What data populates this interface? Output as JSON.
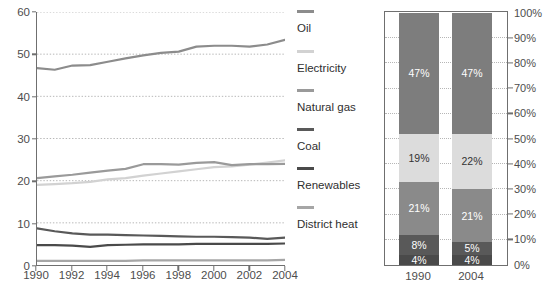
{
  "chart_data": [
    {
      "type": "line",
      "title": "",
      "xlabel": "",
      "ylabel": "EJ",
      "xlim": [
        1990,
        2004
      ],
      "ylim": [
        0,
        60
      ],
      "grid": true,
      "x": [
        1990,
        1991,
        1992,
        1993,
        1994,
        1995,
        1996,
        1997,
        1998,
        1999,
        2000,
        2001,
        2002,
        2003,
        2004
      ],
      "xticks": [
        "1990",
        "1992",
        "1994",
        "1996",
        "1998",
        "2000",
        "2002",
        "2004"
      ],
      "yticks": [
        "0",
        "10",
        "20",
        "30",
        "40",
        "50",
        "60"
      ],
      "legend_position": "right",
      "series": [
        {
          "name": "Oil",
          "color": "#8c8c8c",
          "values": [
            46.7,
            46.3,
            47.3,
            47.4,
            48.2,
            49.0,
            49.7,
            50.3,
            50.6,
            51.8,
            52.0,
            52.0,
            51.8,
            52.3,
            53.4
          ]
        },
        {
          "name": "Electricity",
          "color": "#d2d2d2",
          "values": [
            19.0,
            19.2,
            19.4,
            19.7,
            20.3,
            20.6,
            21.2,
            21.7,
            22.2,
            22.7,
            23.2,
            23.4,
            23.8,
            24.3,
            24.8
          ]
        },
        {
          "name": "Natural gas",
          "color": "#9a9a9a",
          "values": [
            20.6,
            21.0,
            21.4,
            21.9,
            22.4,
            22.8,
            23.9,
            23.9,
            23.8,
            24.2,
            24.4,
            23.7,
            23.9,
            23.9,
            24.0
          ]
        },
        {
          "name": "Coal",
          "color": "#595959",
          "values": [
            8.7,
            8.0,
            7.5,
            7.2,
            7.2,
            7.1,
            7.0,
            6.9,
            6.8,
            6.7,
            6.7,
            6.6,
            6.5,
            6.2,
            6.5
          ]
        },
        {
          "name": "Renewables",
          "color": "#4a4a4a",
          "values": [
            4.7,
            4.7,
            4.6,
            4.3,
            4.7,
            4.8,
            4.9,
            4.9,
            4.9,
            5.0,
            5.0,
            5.0,
            5.0,
            5.0,
            5.1
          ]
        },
        {
          "name": "District heat",
          "color": "#a6a6a6",
          "values": [
            1.0,
            1.0,
            1.0,
            1.0,
            1.0,
            1.0,
            1.1,
            1.1,
            1.1,
            1.1,
            1.1,
            1.1,
            1.1,
            1.1,
            1.2
          ]
        }
      ]
    },
    {
      "type": "bar",
      "subtype": "stacked-percent",
      "title": "",
      "xlabel": "",
      "ylabel": "",
      "ylim": [
        0,
        100
      ],
      "grid": true,
      "categories": [
        "1990",
        "2004"
      ],
      "yticks": [
        "0%",
        "10%",
        "20%",
        "30%",
        "40%",
        "50%",
        "60%",
        "70%",
        "80%",
        "90%",
        "100%"
      ],
      "series": [
        {
          "name": "District heat",
          "color": "#4a4a4a",
          "text_color": "#ffffff",
          "values": [
            4,
            4
          ],
          "labels": [
            "4%",
            "4%"
          ]
        },
        {
          "name": "Renewables",
          "color": "#595959",
          "text_color": "#ffffff",
          "values": [
            8,
            5
          ],
          "labels": [
            "8%",
            "5%"
          ]
        },
        {
          "name": "Coal",
          "color": "#8a8a8a",
          "text_color": "#ffffff",
          "values": [
            21,
            21
          ],
          "labels": [
            "21%",
            "21%"
          ]
        },
        {
          "name": "Natural gas",
          "color": "#dcdcdc",
          "text_color": "#333333",
          "values": [
            19,
            22
          ],
          "labels": [
            "19%",
            "22%"
          ]
        },
        {
          "name": "Oil",
          "color": "#7d7d7d",
          "text_color": "#ffffff",
          "values": [
            48,
            48
          ],
          "labels": [
            "47%",
            "47%"
          ]
        }
      ]
    }
  ],
  "line_chart": {
    "y_axis_unit": "EJ",
    "y_ticks": [
      "0",
      "10",
      "20",
      "30",
      "40",
      "50",
      "60"
    ],
    "x_ticks": [
      "1990",
      "1992",
      "1994",
      "1996",
      "1998",
      "2000",
      "2002",
      "2004"
    ]
  },
  "legend": {
    "items": [
      {
        "label": "Oil",
        "color": "#8c8c8c"
      },
      {
        "label": "Electricity",
        "color": "#d2d2d2"
      },
      {
        "label": "Natural gas",
        "color": "#9a9a9a"
      },
      {
        "label": "Coal",
        "color": "#595959"
      },
      {
        "label": "Renewables",
        "color": "#4a4a4a"
      },
      {
        "label": "District heat",
        "color": "#a6a6a6"
      }
    ]
  },
  "bar_chart": {
    "y_ticks": [
      "100%",
      "90%",
      "80%",
      "70%",
      "60%",
      "50%",
      "40%",
      "30%",
      "20%",
      "10%",
      "0%"
    ],
    "x_labels": [
      "1990",
      "2004"
    ]
  },
  "colors": {
    "axis": "#6f6f6f",
    "grid": "#b6b6b6",
    "text": "#4d4d4d",
    "background": "#ffffff"
  }
}
